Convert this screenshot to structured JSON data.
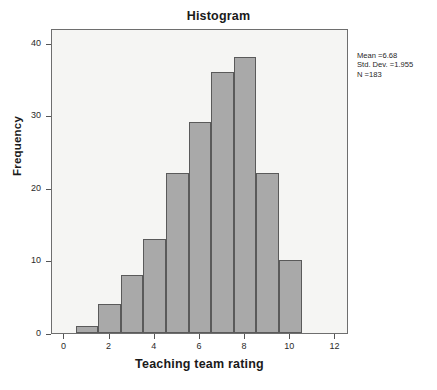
{
  "chart_data": {
    "type": "bar",
    "title": "Histogram",
    "xlabel": "Teaching team rating",
    "ylabel": "Frequency",
    "grid": false,
    "legend": null,
    "xlim": [
      -0.55,
      12.6
    ],
    "ylim": [
      0,
      42
    ],
    "xticks": [
      0,
      2,
      4,
      6,
      8,
      10,
      12
    ],
    "xtick_labels": [
      "0",
      "2",
      "4",
      "6",
      "8",
      "10",
      "12"
    ],
    "yticks": [
      0,
      10,
      20,
      30,
      40
    ],
    "ytick_labels": [
      "0",
      "10",
      "20",
      "30",
      "40"
    ],
    "bin_width": 1,
    "bin_edges": [
      0.5,
      1.5,
      2.5,
      3.5,
      4.5,
      5.5,
      6.5,
      7.5,
      8.5,
      9.5,
      10.5
    ],
    "bin_centers": [
      1,
      2,
      3,
      4,
      5,
      6,
      7,
      8,
      9,
      10
    ],
    "categories": [
      "1",
      "2",
      "3",
      "4",
      "5",
      "6",
      "7",
      "8",
      "9",
      "10"
    ],
    "values": [
      1,
      4,
      8,
      13,
      22,
      29,
      36,
      38,
      22,
      10
    ],
    "bar_color": "#a9a9a9",
    "bar_edge_color": "#5a5a5a",
    "plot_background": "#f5f5f3",
    "annotations": {
      "mean_label": "Mean =6.68",
      "std_label": "Std. Dev. =1.955",
      "n_label": "N =183",
      "mean": 6.68,
      "std_dev": 1.955,
      "n": 183
    }
  }
}
